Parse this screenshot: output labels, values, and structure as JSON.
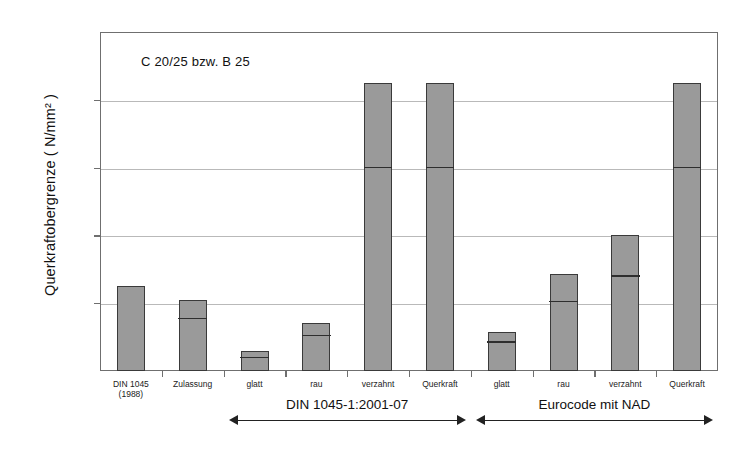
{
  "chart_data": {
    "type": "bar",
    "title": "",
    "annotation": "C 20/25 bzw. B 25",
    "xlabel": "",
    "ylabel": "Querkraftobergrenze ( N/mm² )",
    "ylim": [
      0.0,
      10.0
    ],
    "ytick_labels": [
      "10,0",
      "8,0",
      "6,0",
      "4,0",
      "2,0",
      "0,0"
    ],
    "ytick_values": [
      10.0,
      8.0,
      6.0,
      4.0,
      2.0,
      0.0
    ],
    "grid": true,
    "legend": "none",
    "categories": [
      "DIN 1045",
      "Zulassung",
      "glatt",
      "rau",
      "verzahnt",
      "Querkraft",
      "glatt",
      "rau",
      "verzahnt",
      "Querkraft"
    ],
    "category_sublabels": [
      "(1988)",
      "",
      "",
      "",
      "",
      "",
      "",
      "",
      "",
      ""
    ],
    "values": [
      2.5,
      2.1,
      0.58,
      1.42,
      8.5,
      8.5,
      1.15,
      2.85,
      4.0,
      8.5
    ],
    "segment_marks": [
      null,
      1.5,
      0.35,
      1.0,
      5.95,
      5.95,
      0.8,
      2.0,
      2.75,
      5.95
    ],
    "groups": [
      {
        "label": "DIN 1045-1:2001-07",
        "from_index": 2,
        "to_index": 5
      },
      {
        "label": "Eurocode mit NAD",
        "from_index": 6,
        "to_index": 9
      }
    ],
    "bar_fill_color": "#9a9a9a",
    "bar_edge_color": "#3a3a3a",
    "grid_color": "#b9b9b9",
    "axis_color": "#6f6f6f"
  }
}
